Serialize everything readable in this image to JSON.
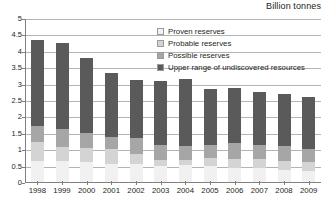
{
  "chart_data": {
    "type": "bar",
    "stacked": true,
    "title": "Billion tonnes",
    "xlabel": "",
    "ylabel": "",
    "ylim": [
      0,
      5
    ],
    "ytick_step": 0.5,
    "yticks": [
      "0",
      "0.5",
      "1",
      "1.5",
      "2",
      "2.5",
      "3",
      "3.5",
      "4",
      "4.5",
      "5"
    ],
    "grid": true,
    "legend_position": "top-right",
    "categories": [
      "1998",
      "1999",
      "2000",
      "2001",
      "2002",
      "2003",
      "2004",
      "2005",
      "2006",
      "2007",
      "2008",
      "2009"
    ],
    "series": [
      {
        "name": "Proven reserves",
        "color": "#f1f1f1",
        "values": [
          0.68,
          0.66,
          0.64,
          0.59,
          0.57,
          0.53,
          0.54,
          0.53,
          0.47,
          0.45,
          0.4,
          0.36
        ]
      },
      {
        "name": "Probable reserves",
        "color": "#d4d4d4",
        "values": [
          0.57,
          0.44,
          0.42,
          0.45,
          0.33,
          0.16,
          0.17,
          0.23,
          0.27,
          0.29,
          0.28,
          0.28
        ]
      },
      {
        "name": "Possible reserves",
        "color": "#a6a6a6",
        "values": [
          0.5,
          0.55,
          0.47,
          0.37,
          0.47,
          0.46,
          0.42,
          0.39,
          0.49,
          0.42,
          0.44,
          0.41
        ]
      },
      {
        "name": "Upper range of undiscovered resources",
        "color": "#5a5a5a",
        "values": [
          2.6,
          2.61,
          2.27,
          1.96,
          1.76,
          1.96,
          2.04,
          1.72,
          1.68,
          1.62,
          1.59,
          1.56
        ]
      }
    ],
    "totals": [
      4.35,
      4.26,
      3.8,
      3.37,
      3.13,
      3.11,
      3.17,
      2.87,
      2.91,
      2.78,
      2.71,
      2.61
    ]
  }
}
